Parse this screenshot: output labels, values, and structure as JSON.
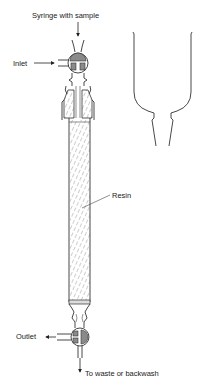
{
  "labels": {
    "syringe": "Syringe with sample",
    "inlet": "Inlet",
    "resin": "Resin",
    "outlet": "Outlet",
    "waste": "To waste or backwash"
  },
  "colors": {
    "line": "#333333",
    "valve_fill": "#8a8a8a",
    "background": "#ffffff"
  }
}
